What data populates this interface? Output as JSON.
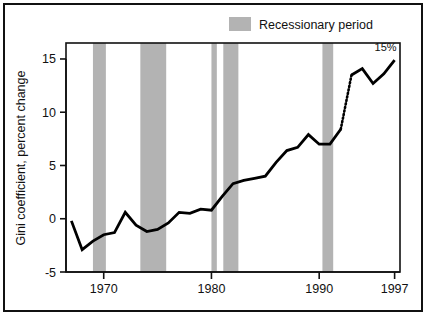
{
  "figure": {
    "background_color": "#ffffff",
    "border_color": "#111111",
    "series_color": "#000000",
    "band_color": "#b3b3b3"
  },
  "legend": {
    "swatch_name": "recession-band-swatch",
    "label": "Recessionary period"
  },
  "annotations": [
    {
      "text": "15%",
      "x": 1997,
      "y": 14.9
    }
  ],
  "chart_data": {
    "type": "line",
    "title": "",
    "subtitle": "",
    "xlabel": "",
    "ylabel": "Gini coefficient, percent change",
    "xlim": [
      1966.5,
      1997.5
    ],
    "ylim": [
      -5,
      16.5
    ],
    "xticks": [
      1970,
      1980,
      1990,
      1997
    ],
    "xtick_labels": [
      "1970",
      "1980",
      "1990",
      "1997"
    ],
    "yticks": [
      -5,
      0,
      5,
      10,
      15
    ],
    "ytick_labels": [
      "-5",
      "0",
      "5",
      "10",
      "15"
    ],
    "grid": false,
    "legend_position": "top-right-outside",
    "series": [
      {
        "name": "Gini coefficient, percent change",
        "style": "solid",
        "x": [
          1967,
          1968,
          1969,
          1970,
          1971,
          1972,
          1973,
          1974,
          1975,
          1976,
          1977,
          1978,
          1979,
          1980,
          1981,
          1982,
          1983,
          1984,
          1985,
          1986,
          1987,
          1988,
          1989,
          1990,
          1991,
          1992
        ],
        "values": [
          -0.2,
          -2.9,
          -2.1,
          -1.5,
          -1.3,
          0.6,
          -0.6,
          -1.2,
          -1.0,
          -0.4,
          0.6,
          0.5,
          0.9,
          0.8,
          2.1,
          3.3,
          3.6,
          3.8,
          4.0,
          5.3,
          6.4,
          6.7,
          7.9,
          7.0,
          7.0,
          8.4
        ]
      },
      {
        "name": "Gini coefficient, percent change (series break)",
        "style": "dotted",
        "x": [
          1992,
          1993
        ],
        "values": [
          8.4,
          13.5
        ]
      },
      {
        "name": "Gini coefficient, percent change (revised)",
        "style": "solid",
        "x": [
          1993,
          1994,
          1995,
          1996,
          1997
        ],
        "values": [
          13.5,
          14.1,
          12.7,
          13.6,
          14.9
        ]
      }
    ],
    "recession_bands": [
      {
        "label": "1969-1970",
        "start": 1969.0,
        "end": 1970.2
      },
      {
        "label": "1973-1975",
        "start": 1973.4,
        "end": 1975.8
      },
      {
        "label": "1980",
        "start": 1980.0,
        "end": 1980.5
      },
      {
        "label": "1981-1982",
        "start": 1981.1,
        "end": 1982.5
      },
      {
        "label": "1990-1991",
        "start": 1990.3,
        "end": 1991.3
      }
    ]
  }
}
